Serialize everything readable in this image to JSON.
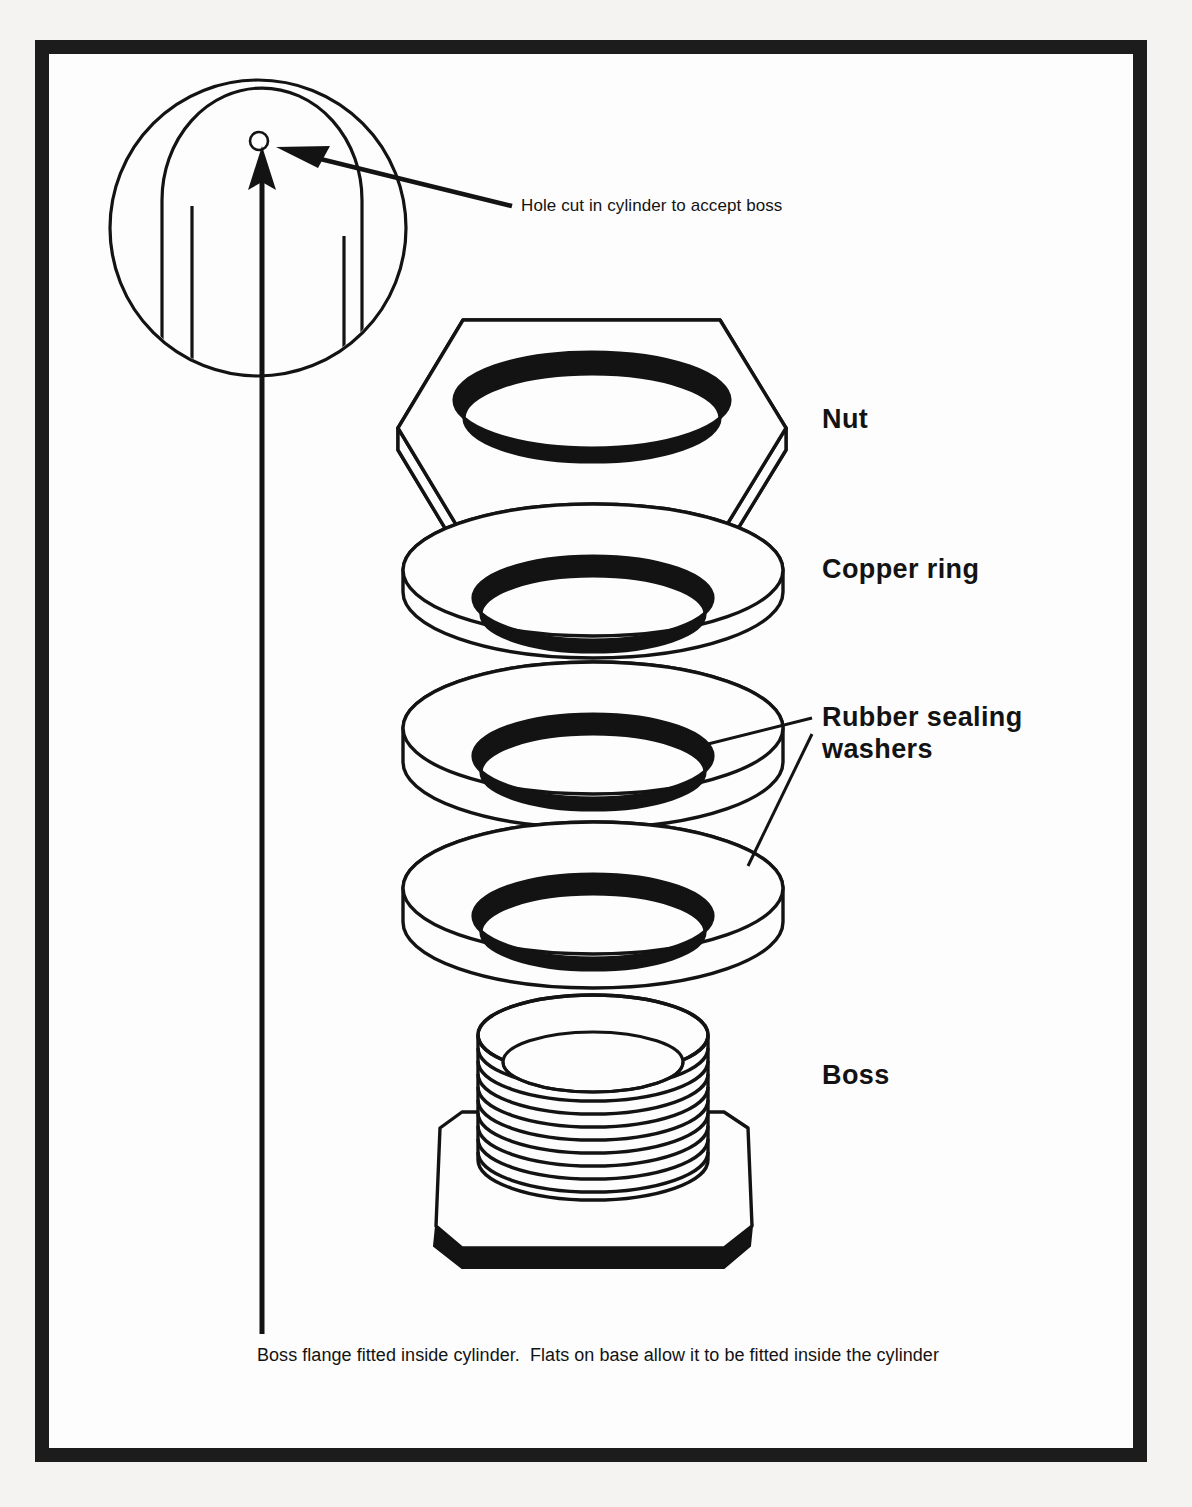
{
  "figure": {
    "type": "exploded-assembly-diagram",
    "background_color": "#fdfdfd",
    "line_color": "#131313",
    "frame_color": "#1c1c1c"
  },
  "part_labels": [
    {
      "id": "nut",
      "text": "Nut"
    },
    {
      "id": "copper",
      "text": "Copper ring"
    },
    {
      "id": "washers",
      "text": "Rubber sealing\nwashers"
    },
    {
      "id": "boss",
      "text": "Boss"
    }
  ],
  "annotations": {
    "hole_note": "Hole cut in cylinder to accept boss",
    "caption": "Boss flange fitted inside cylinder.  Flats on base allow it to be fitted inside the cylinder"
  },
  "detail_view": {
    "name": "cylinder-hole-detail",
    "description": "Circular detail view of cylinder end showing hole cut to accept boss"
  },
  "parts_stack_order": [
    "Nut",
    "Copper ring",
    "Rubber sealing washers",
    "Rubber sealing washers",
    "Boss"
  ]
}
